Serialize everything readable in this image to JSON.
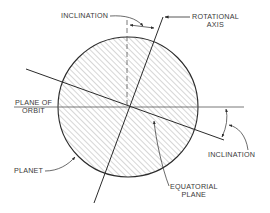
{
  "diagram": {
    "type": "planet-axial-inclination",
    "colors": {
      "ink": "#2b2b2b",
      "hatch": "#7a7a7a",
      "background": "#ffffff"
    },
    "labels": {
      "inclination_top": "INCLINATION",
      "rotational_axis_line1": "ROTATIONAL",
      "rotational_axis_line2": "AXIS",
      "plane_of_orbit_line1": "PLANE OF",
      "plane_of_orbit_line2": "ORBIT",
      "planet": "PLANET",
      "equatorial_plane_line1": "EQUATORIAL",
      "equatorial_plane_line2": "PLANE",
      "inclination_right": "INCLINATION"
    }
  }
}
